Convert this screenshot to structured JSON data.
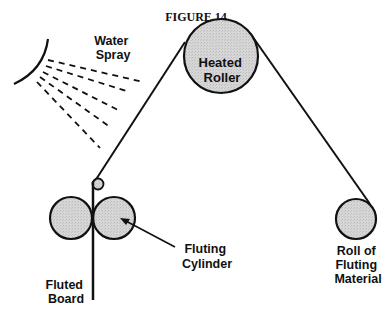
{
  "figure": {
    "title": "FIGURE 14"
  },
  "labels": {
    "water_spray": [
      "Water",
      "Spray"
    ],
    "heated_roller": [
      "Heated",
      "Roller"
    ],
    "roll_of_fluting_material": [
      "Roll of",
      "Fluting",
      "Material"
    ],
    "fluting_cylinder": [
      "Fluting",
      "Cylinder"
    ],
    "fluted_board": [
      "Fluted",
      "Board"
    ]
  },
  "colors": {
    "roller_fill": "#d4d4d4",
    "stroke": "#111111",
    "background": "#ffffff"
  },
  "components": [
    {
      "name": "Water Spray",
      "type": "spray-nozzle"
    },
    {
      "name": "Heated Roller",
      "type": "roller"
    },
    {
      "name": "Roll of Fluting Material",
      "type": "supply-roll"
    },
    {
      "name": "Guide Roller",
      "type": "small-roller"
    },
    {
      "name": "Fluting Cylinder",
      "type": "cylinder-pair"
    },
    {
      "name": "Fluted Board",
      "type": "output"
    }
  ]
}
